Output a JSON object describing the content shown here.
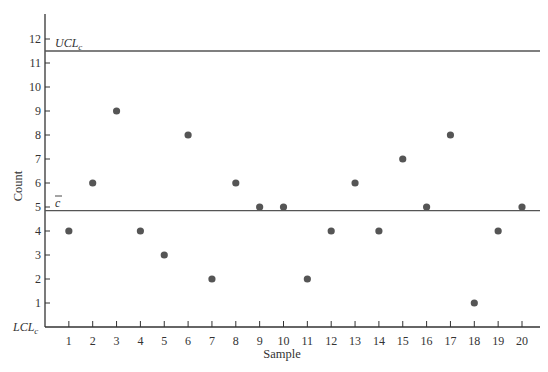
{
  "chart_data": {
    "type": "scatter",
    "title": "",
    "xlabel": "Sample",
    "ylabel": "Count",
    "x": [
      1,
      2,
      3,
      4,
      5,
      6,
      7,
      8,
      9,
      10,
      11,
      12,
      13,
      14,
      15,
      16,
      17,
      18,
      19,
      20
    ],
    "values": [
      4,
      6,
      9,
      4,
      3,
      8,
      2,
      6,
      5,
      5,
      2,
      4,
      6,
      4,
      7,
      5,
      8,
      1,
      4,
      5
    ],
    "x_ticks": [
      1,
      2,
      3,
      4,
      5,
      6,
      7,
      8,
      9,
      10,
      11,
      12,
      13,
      14,
      15,
      16,
      17,
      18,
      19,
      20
    ],
    "y_ticks": [
      1,
      2,
      3,
      4,
      5,
      6,
      7,
      8,
      9,
      10,
      11,
      12
    ],
    "xlim": [
      0,
      21
    ],
    "ylim": [
      0,
      13
    ],
    "grid": false,
    "legend": "none",
    "control_lines": [
      {
        "name": "UCL_c",
        "label": "UCL",
        "subscript": "c",
        "value": 11.5
      },
      {
        "name": "c_bar",
        "label": "c",
        "overline": true,
        "value": 4.85
      },
      {
        "name": "LCL_c",
        "label": "LCL",
        "subscript": "c",
        "value": 0
      }
    ],
    "colors": {
      "point": "#555555",
      "line": "#555555",
      "axis": "#333333"
    }
  },
  "labels": {
    "xlabel": "Sample",
    "ylabel": "Count",
    "ucl_main": "UCL",
    "ucl_sub": "c",
    "lcl_main": "LCL",
    "lcl_sub": "c",
    "cbar": "c"
  }
}
